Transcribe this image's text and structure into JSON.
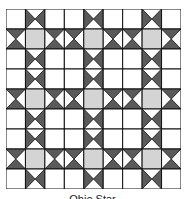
{
  "figure": {
    "caption": "Ohio Star"
  },
  "grid": {
    "rows": 9,
    "cols": 9,
    "cell_width": 19.44,
    "cell_height": 20,
    "cells": [
      [
        "white",
        "hv",
        "white",
        "white",
        "hv",
        "white",
        "white",
        "hv",
        "white"
      ],
      [
        "hh",
        "gray",
        "hh",
        "hh",
        "gray",
        "hh",
        "hh",
        "gray",
        "hh"
      ],
      [
        "white",
        "hv",
        "white",
        "white",
        "hv",
        "white",
        "white",
        "hv",
        "white"
      ],
      [
        "white",
        "hv",
        "white",
        "white",
        "hv",
        "white",
        "white",
        "hv",
        "white"
      ],
      [
        "hh",
        "gray",
        "hh",
        "hh",
        "gray",
        "hh",
        "hh",
        "gray",
        "hh"
      ],
      [
        "white",
        "hv",
        "white",
        "white",
        "hv",
        "white",
        "white",
        "hv",
        "white"
      ],
      [
        "white",
        "hv",
        "white",
        "white",
        "hv",
        "white",
        "white",
        "hv",
        "white"
      ],
      [
        "hh",
        "gray",
        "hh",
        "hh",
        "gray",
        "hh",
        "hh",
        "gray",
        "hh"
      ],
      [
        "white",
        "hv",
        "white",
        "white",
        "hv",
        "white",
        "white",
        "hv",
        "white"
      ]
    ],
    "legend": {
      "white": "plain white square",
      "gray": "light gray center square",
      "hv": "hourglass, dark triangles left and right",
      "hh": "hourglass, dark triangles top and bottom"
    }
  },
  "colors": {
    "dark": "#5a5a5a",
    "gray": "#d4d4d4",
    "white": "#ffffff",
    "line": "#111111"
  }
}
